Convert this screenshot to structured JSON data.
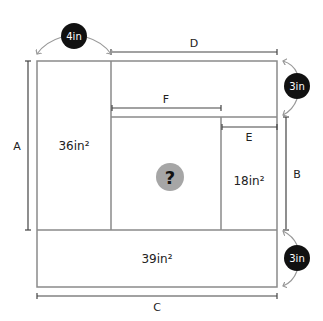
{
  "diagram": {
    "regions": {
      "left_area": "36in²",
      "right_small_area": "18in²",
      "bottom_area": "39in²",
      "unknown": "?"
    },
    "dimension_labels": {
      "A": "A",
      "B": "B",
      "C": "C",
      "D": "D",
      "E": "E",
      "F": "F"
    },
    "callouts": {
      "top_left": "4in",
      "top_right": "3in",
      "bottom_right": "3in"
    },
    "colors": {
      "line": "#8a8a8a",
      "callout_fill": "#111111",
      "question_fill": "#a6a6a6"
    }
  }
}
